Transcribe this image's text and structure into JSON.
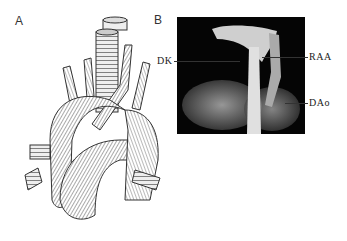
{
  "figure": {
    "panels": [
      {
        "id": "A",
        "label": "A",
        "description": "Line drawing of heart with right aortic arch and great vessels around trachea"
      },
      {
        "id": "B",
        "label": "B",
        "description": "3D CT volume rendering of aortic arch"
      }
    ],
    "annotations": [
      {
        "label": "DK",
        "side": "left"
      },
      {
        "label": "RAA",
        "side": "right"
      },
      {
        "label": "DAo",
        "side": "right"
      }
    ],
    "colors": {
      "background": "#ffffff",
      "ct_background": "#050505",
      "ink": "#333333"
    }
  }
}
